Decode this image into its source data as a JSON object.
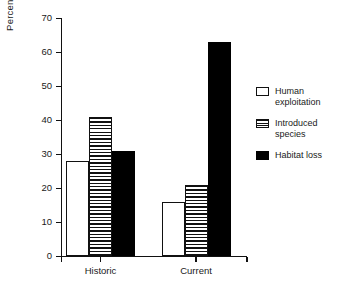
{
  "chart_data": {
    "type": "bar",
    "title": "",
    "subtitle": "",
    "xlabel": "",
    "ylabel": "Percent of species",
    "categories": [
      "Historic",
      "Current"
    ],
    "series": [
      {
        "name": "Human exploitation",
        "values": [
          28,
          16
        ],
        "fill": "white"
      },
      {
        "name": "Introduced species",
        "values": [
          41,
          21
        ],
        "fill": "stripe"
      },
      {
        "name": "Habitat loss",
        "values": [
          31,
          63
        ],
        "fill": "black"
      }
    ],
    "ylim": [
      0,
      70
    ],
    "ytick_values": [
      0,
      10,
      20,
      30,
      40,
      50,
      60,
      70
    ],
    "ytick_labels": [
      "0",
      "10",
      "20",
      "30",
      "40",
      "50",
      "60",
      "70"
    ],
    "grid": false,
    "legend_position": "right",
    "legend": [
      {
        "label": "Human\nexploitation",
        "swatch": "swatch-white"
      },
      {
        "label": "Introduced\nspecies",
        "swatch": "swatch-striped"
      },
      {
        "label": "Habitat loss",
        "swatch": "swatch-black"
      }
    ],
    "colors": {
      "line": "#111111",
      "text": "#1a1a1a",
      "background": "#ffffff",
      "bar_black": "#000000",
      "bar_white": "#ffffff"
    }
  }
}
